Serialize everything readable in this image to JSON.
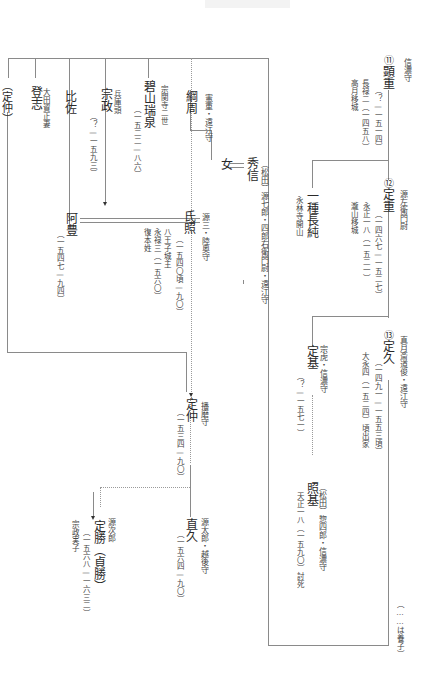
{
  "diagram": {
    "type": "genealogy",
    "orientation": "vertical-rl",
    "legend": "（……は養子）",
    "persons": {
      "akishige": {
        "number": "⑪",
        "name": "顕重",
        "title": "信濃守",
        "years": "（？—一五一四）",
        "note1": "長禄二（一四五八）",
        "note2": "高月移城"
      },
      "sadashige": {
        "number": "⑫",
        "name": "定重",
        "title": "源左衛門尉",
        "years": "（一四六七—一五二七）",
        "note1": "永正一八（一五二一）",
        "note2": "瀧山移城"
      },
      "nagazumi": {
        "name": "一種長純",
        "note1": "永林寺開山"
      },
      "sadahisa": {
        "number": "⑬",
        "name": "定久",
        "title": "真月斎道俊・遠江守",
        "years": "（一四九一—一五五三頃）",
        "note1": "大永四（一五二四）頃出家"
      },
      "sadamoto": {
        "name": "定基",
        "title": "宗虎・信濃守",
        "years": "（？—一五七一）"
      },
      "terumoto": {
        "name": "照基",
        "title": "（松田）惣四郎・信濃守",
        "note1": "天正一八（一五九〇）討死"
      },
      "hidenobu": {
        "name": "秀信",
        "title": "（松田）源七郎・四郎右衛門尉・遠江守"
      },
      "onna": {
        "name": "女"
      },
      "tsunachika": {
        "name": "綱周",
        "title": "憲重・遠江守"
      },
      "ujiteru": {
        "name": "氏照",
        "title": "源三・陸奥守",
        "years": "（一五四〇頃—九〇）",
        "note1": "八王子城主",
        "note2": "永禄三（一五六〇）",
        "note3": "復本姓"
      },
      "zuisen": {
        "name": "碧山瑞泉",
        "title": "宗関寺二世",
        "years": "（一五二二—八六）"
      },
      "munemasa": {
        "name": "宗政",
        "title": "兵庫頭",
        "years": "（？—一五九三）"
      },
      "hisa": {
        "name": "比佐"
      },
      "toshi": {
        "name": "登志",
        "title": "大田資正妻"
      },
      "sadanaka_ref": {
        "name": "（定仲）"
      },
      "ahou": {
        "name": "阿豊",
        "years": "（一五四七—九四）"
      },
      "sadanaka": {
        "name": "定仲",
        "title": "播磨守",
        "years": "（一五三四—九〇）"
      },
      "naohisa": {
        "name": "直久",
        "title": "源太郎・越後守",
        "years": "（一五六四—九〇）"
      },
      "sadakatsu": {
        "name": "定勝（貞勝）",
        "title": "源次郎",
        "years": "（一五六八—一六三二）",
        "note1": "宗政実子"
      }
    }
  }
}
